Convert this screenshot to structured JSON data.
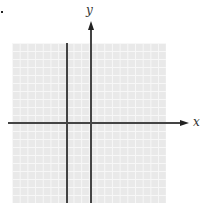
{
  "figure": {
    "type": "coordinate-plane",
    "x_axis_label": "x",
    "y_axis_label": "y",
    "grid": true,
    "colors": {
      "grid_background": "#e9e9e9",
      "grid_lines": "#f7f7f7",
      "axis": "#444444"
    }
  }
}
